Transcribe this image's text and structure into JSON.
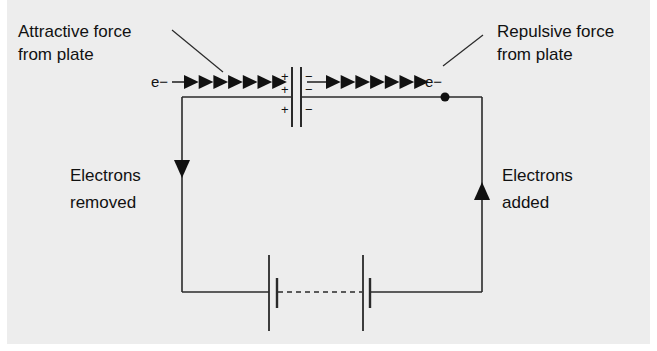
{
  "diagram": {
    "labels": {
      "attractive": [
        "Attractive force",
        "from plate"
      ],
      "repulsive": [
        "Repulsive force",
        "from plate"
      ],
      "removed": [
        "Electrons",
        "removed"
      ],
      "added": [
        "Electrons",
        "added"
      ]
    },
    "electron_symbol": "e−",
    "plus_sign": "+",
    "minus_sign": "−",
    "left_plate_charges": [
      "+",
      "+",
      "+"
    ],
    "right_plate_charges": [
      "−",
      "−",
      "−"
    ],
    "arrow_count_left": 7,
    "arrow_count_right": 7,
    "colors": {
      "line": "#2a2a2a",
      "panel": "#ededed",
      "text": "#111111"
    }
  }
}
